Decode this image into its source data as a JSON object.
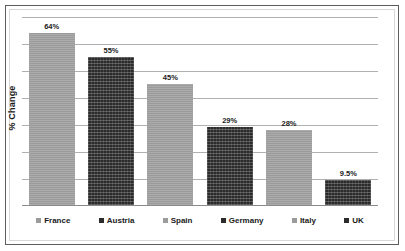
{
  "chart_data": {
    "type": "bar",
    "title": "",
    "subtitle": "",
    "xlabel": "",
    "ylabel": "% Change",
    "categories": [
      "France",
      "Austria",
      "Spain",
      "Germany",
      "Italy",
      "UK"
    ],
    "values": [
      64,
      55,
      45,
      29,
      28,
      9.5
    ],
    "value_labels": [
      "64%",
      "55%",
      "45%",
      "29%",
      "28%",
      "9.5%"
    ],
    "ylim": [
      0,
      70
    ],
    "grid": true,
    "gridline_values": [
      10,
      20,
      30,
      40,
      50,
      60,
      70
    ],
    "y_tick_labels_visible": false,
    "legend_position": "bottom",
    "series": [
      {
        "name": "% Change",
        "values": [
          64,
          55,
          45,
          29,
          28,
          9.5
        ]
      }
    ],
    "bar_colors": [
      "#9b9b9b",
      "#2b2b2b",
      "#9b9b9b",
      "#2b2b2b",
      "#9b9b9b",
      "#2b2b2b"
    ],
    "colors": {
      "light_bar": "#9b9b9b",
      "dark_bar": "#2b2b2b",
      "gridline": "#b0b0b0",
      "axis": "#8a8a8a",
      "frame": "#5d5d5d",
      "inner_frame": "#d8d8d8",
      "text": "#1a1a1a",
      "background": "#ffffff"
    }
  },
  "legend": {
    "items": [
      {
        "label": "France",
        "shade": "light"
      },
      {
        "label": "Austria",
        "shade": "dark"
      },
      {
        "label": "Spain",
        "shade": "light"
      },
      {
        "label": "Germany",
        "shade": "dark"
      },
      {
        "label": "Italy",
        "shade": "light"
      },
      {
        "label": "UK",
        "shade": "dark"
      }
    ]
  }
}
